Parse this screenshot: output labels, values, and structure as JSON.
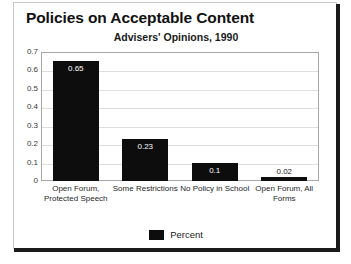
{
  "chart_data": {
    "type": "bar",
    "title": "Policies on Acceptable Content",
    "subtitle": "Advisers' Opinions, 1990",
    "xlabel": "",
    "ylabel": "",
    "ylim": [
      0,
      0.7
    ],
    "ytick_labels": [
      "0.7",
      "0.6",
      "0.5",
      "0.4",
      "0.3",
      "0.2",
      "0.1",
      "0"
    ],
    "ytick_values": [
      0.7,
      0.6,
      0.5,
      0.4,
      0.3,
      0.2,
      0.1,
      0
    ],
    "grid": true,
    "legend_position": "bottom",
    "categories": [
      "Open Forum, Protected Speech",
      "Some Restrictions",
      "No Policy in School",
      "Open Forum, All Forms"
    ],
    "category_lines": [
      [
        "Open Forum,",
        "Protected Speech"
      ],
      [
        "Some Restrictions"
      ],
      [
        "No Policy in School"
      ],
      [
        "Open Forum, All",
        "Forms"
      ]
    ],
    "series": [
      {
        "name": "Percent",
        "color": "#0d0d0d",
        "values": [
          0.65,
          0.23,
          0.1,
          0.02
        ],
        "value_labels": [
          "0.65",
          "0.23",
          "0.1",
          "0.02"
        ]
      }
    ]
  },
  "legend": {
    "entries": [
      {
        "label": "Percent",
        "color": "#0d0d0d"
      }
    ]
  },
  "colors": {
    "bar": "#0d0d0d",
    "grid": "#dedede",
    "plot_border": "#a8a8a8",
    "card_border": "#c9c9c9",
    "frame_shadow": "#1b1b1b",
    "text": "#111111"
  }
}
